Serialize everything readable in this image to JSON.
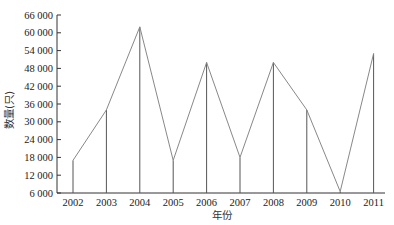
{
  "chart_data": {
    "type": "line",
    "title": "",
    "xlabel": "年份",
    "ylabel": "数量(只)",
    "categories": [
      "2002",
      "2003",
      "2004",
      "2005",
      "2006",
      "2007",
      "2008",
      "2009",
      "2010",
      "2011"
    ],
    "series": [
      {
        "name": "数量",
        "values": [
          17000,
          34000,
          62000,
          17000,
          50000,
          18000,
          50000,
          34000,
          6500,
          53000
        ],
        "drop_lines": true
      }
    ],
    "ylim": [
      6000,
      66000
    ],
    "yticks": [
      6000,
      12000,
      18000,
      24000,
      30000,
      36000,
      42000,
      48000,
      54000,
      60000,
      66000
    ],
    "ytick_labels": [
      "6 000",
      "12 000",
      "18 000",
      "24 000",
      "30 000",
      "36 000",
      "42 000",
      "48 000",
      "54 000",
      "60 000",
      "66 000"
    ],
    "grid": false,
    "legend": null,
    "line_color": "#888888",
    "axis_color": "#333333"
  }
}
